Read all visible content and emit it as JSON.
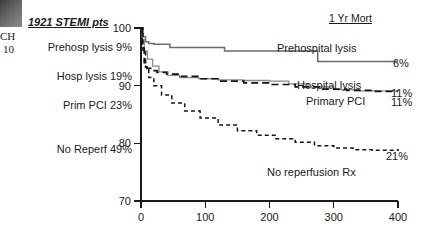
{
  "artifact": {
    "line1": "CH",
    "line2": "10"
  },
  "legend": {
    "title": "1921 STEMI pts",
    "items": [
      {
        "label": "Prehosp lysis 9%"
      },
      {
        "label": "Hosp lysis 19%"
      },
      {
        "label": "Prim PCI 23%"
      },
      {
        "label": "No Reperf 49%"
      }
    ]
  },
  "header": {
    "mortality_title": "1 Yr Mort"
  },
  "series_labels": {
    "prehospital_lysis": "Prehospital lysis",
    "prehospital_lysis_value": "6%",
    "hospital_lysis": "Hospital lysis",
    "hospital_lysis_value": "11%",
    "primary_pci": "Primary PCI",
    "primary_pci_value": "11%",
    "no_reperfusion": "No reperfusion Rx",
    "no_reperfusion_value": "21%"
  },
  "axes": {
    "y_ticks": [
      "100",
      "90",
      "80",
      "70"
    ],
    "x_ticks": [
      "0",
      "100",
      "200",
      "300",
      "400"
    ]
  },
  "colors": {
    "prehospital_lysis": "#6b6b6b",
    "hospital_lysis": "#141414",
    "primary_pci": "#8a8a8a",
    "no_reperfusion": "#141414",
    "axis": "#1a1a1a",
    "background": "#ffffff"
  },
  "chart_data": {
    "type": "line",
    "title": "1921 STEMI pts",
    "xlabel": "",
    "ylabel": "",
    "xlim": [
      0,
      400
    ],
    "ylim": [
      70,
      100
    ],
    "grid": false,
    "legend_position": "in-plot-right",
    "x_ticks": [
      0,
      100,
      200,
      300,
      400
    ],
    "y_ticks": [
      70,
      80,
      90,
      100
    ],
    "annotations": [
      {
        "text": "1 Yr Mort",
        "position": "top-right"
      },
      {
        "text": "Prehosp lysis 9%",
        "position": "left-legend"
      },
      {
        "text": "Hosp lysis 19%",
        "position": "left-legend"
      },
      {
        "text": "Prim PCI 23%",
        "position": "left-legend"
      },
      {
        "text": "No Reperf 49%",
        "position": "left-legend"
      }
    ],
    "series": [
      {
        "name": "Prehospital lysis",
        "style": "solid",
        "color": "#6b6b6b",
        "one_year_mortality": "6%",
        "x": [
          0,
          3,
          7,
          12,
          20,
          30,
          45,
          62,
          95,
          130,
          175,
          215,
          255,
          275,
          300,
          340,
          400
        ],
        "y": [
          100,
          98.5,
          97.6,
          97.3,
          97.2,
          97.2,
          96.6,
          96.6,
          96.6,
          96.0,
          96.0,
          96.0,
          96.0,
          94.2,
          94.2,
          94.2,
          94.2
        ]
      },
      {
        "name": "Hospital lysis",
        "style": "dashed",
        "color": "#141414",
        "one_year_mortality": "11%",
        "x": [
          0,
          2,
          5,
          9,
          15,
          25,
          40,
          60,
          90,
          120,
          160,
          200,
          240,
          280,
          320,
          360,
          400
        ],
        "y": [
          100,
          96.5,
          94.0,
          93.0,
          92.6,
          92.3,
          92.0,
          91.6,
          91.2,
          90.8,
          90.5,
          90.2,
          89.8,
          89.4,
          89.2,
          89.0,
          89.0
        ]
      },
      {
        "name": "Primary PCI",
        "style": "solid-thin",
        "color": "#8a8a8a",
        "one_year_mortality": "11%",
        "x": [
          0,
          2,
          5,
          10,
          18,
          28,
          42,
          60,
          90,
          120,
          160,
          200,
          230,
          260,
          300,
          340,
          400
        ],
        "y": [
          100,
          98.0,
          96.0,
          94.6,
          93.4,
          92.4,
          91.8,
          91.4,
          91.2,
          91.0,
          90.9,
          90.8,
          90.3,
          89.8,
          89.3,
          89.1,
          89.0
        ]
      },
      {
        "name": "No reperfusion Rx",
        "style": "dotted",
        "color": "#141414",
        "one_year_mortality": "21%",
        "x": [
          0,
          3,
          7,
          12,
          20,
          32,
          48,
          68,
          92,
          120,
          150,
          180,
          210,
          240,
          270,
          300,
          330,
          360,
          400
        ],
        "y": [
          100,
          96.0,
          93.2,
          91.4,
          90.0,
          88.4,
          87.0,
          85.6,
          84.4,
          83.2,
          82.2,
          81.4,
          80.8,
          80.2,
          79.6,
          79.2,
          78.9,
          78.8,
          79.0
        ]
      }
    ]
  }
}
